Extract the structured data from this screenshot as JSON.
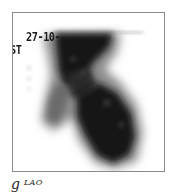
{
  "figure": {
    "panel_letter": "g",
    "view_label": "LAO",
    "overlay": {
      "date_text": "27-10-",
      "side_text": "ST"
    },
    "colors": {
      "uptake": "#111111",
      "background": "#ffffff",
      "border": "#8a8a8a"
    }
  }
}
